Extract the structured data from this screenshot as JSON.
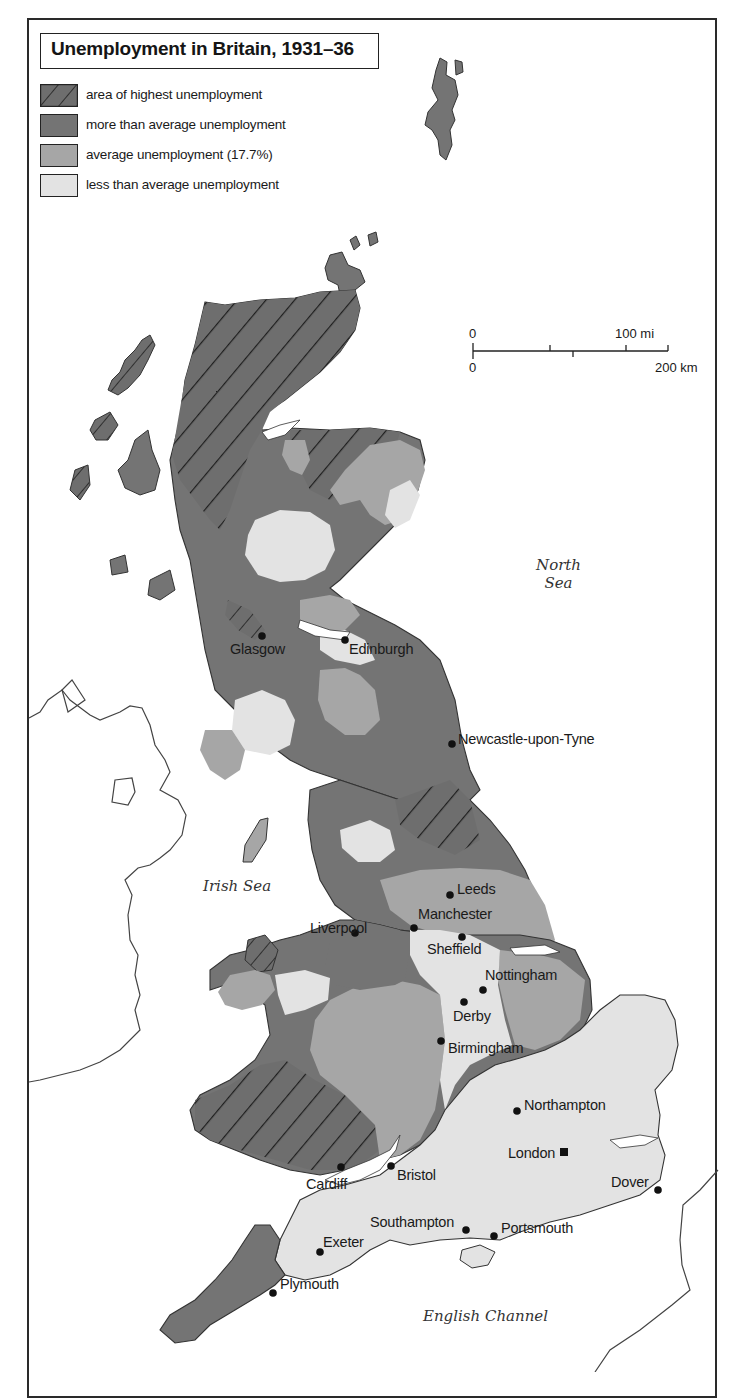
{
  "title": "Unemployment in Britain, 1931–36",
  "legend": [
    {
      "id": "highest",
      "label": "area of highest unemployment",
      "pattern": "hatched",
      "color": "#6e6e6e"
    },
    {
      "id": "above",
      "label": "more than average unemployment",
      "pattern": "solid",
      "color": "#747474"
    },
    {
      "id": "average",
      "label": "average unemployment (17.7%)",
      "pattern": "solid",
      "color": "#a6a6a6"
    },
    {
      "id": "below",
      "label": "less than average unemployment",
      "pattern": "solid",
      "color": "#e3e3e3"
    }
  ],
  "scale_bar": {
    "miles_start": "0",
    "miles_end": "100 mi",
    "km_start": "0",
    "km_end": "200 km"
  },
  "seas": {
    "north_sea_line1": "North",
    "north_sea_line2": "Sea",
    "irish_sea": "Irish Sea",
    "english_channel": "English Channel"
  },
  "cities": [
    {
      "name": "Glasgow",
      "marker": "dot"
    },
    {
      "name": "Edinburgh",
      "marker": "dot"
    },
    {
      "name": "Newcastle-upon-Tyne",
      "marker": "dot"
    },
    {
      "name": "Leeds",
      "marker": "dot"
    },
    {
      "name": "Liverpool",
      "marker": "dot"
    },
    {
      "name": "Manchester",
      "marker": "dot"
    },
    {
      "name": "Sheffield",
      "marker": "dot"
    },
    {
      "name": "Nottingham",
      "marker": "dot"
    },
    {
      "name": "Derby",
      "marker": "dot"
    },
    {
      "name": "Birmingham",
      "marker": "dot"
    },
    {
      "name": "Northampton",
      "marker": "dot"
    },
    {
      "name": "London",
      "marker": "square"
    },
    {
      "name": "Cardiff",
      "marker": "dot"
    },
    {
      "name": "Bristol",
      "marker": "dot"
    },
    {
      "name": "Dover",
      "marker": "dot"
    },
    {
      "name": "Southampton",
      "marker": "dot"
    },
    {
      "name": "Portsmouth",
      "marker": "dot"
    },
    {
      "name": "Exeter",
      "marker": "dot"
    },
    {
      "name": "Plymouth",
      "marker": "dot"
    }
  ],
  "colors": {
    "highest": "#6e6e6e",
    "above": "#747474",
    "average": "#a6a6a6",
    "below": "#e3e3e3",
    "outline": "#333333",
    "hatch": "#1e1e1e"
  }
}
